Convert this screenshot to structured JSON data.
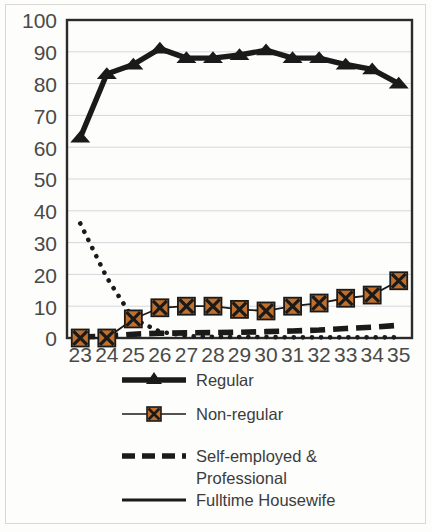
{
  "figure": {
    "kind": "line-chart",
    "background_color": "#fdfdfc",
    "plot_border_color": "#2b2b2b",
    "gridline_color": "#d5d7dc",
    "line_color": "#1a1a1a",
    "marker_fill_color": "#c0702c"
  },
  "chart_data": {
    "type": "line",
    "title": "",
    "subtitle": "",
    "xlabel": "",
    "ylabel": "",
    "x": [
      23,
      24,
      25,
      26,
      27,
      28,
      29,
      30,
      31,
      32,
      33,
      34,
      35
    ],
    "xtick_labels": [
      "23",
      "24",
      "25",
      "26",
      "27",
      "28",
      "29",
      "30",
      "31",
      "32",
      "33",
      "34",
      "35"
    ],
    "ytick_labels": [
      "0",
      "10",
      "20",
      "30",
      "40",
      "50",
      "60",
      "70",
      "80",
      "90",
      "100"
    ],
    "ylim": [
      0,
      100
    ],
    "ytick_step": 10,
    "grid": "horizontal",
    "legend_position": "bottom",
    "series": [
      {
        "name": "Regular",
        "style": "solid-thick",
        "marker": "triangle",
        "marker_fill": "#1a1a1a",
        "values": [
          63,
          83,
          86,
          91,
          88,
          88,
          89,
          90.5,
          88,
          88,
          86,
          84.5,
          80
        ]
      },
      {
        "name": "Non-regular",
        "style": "solid-thin",
        "marker": "square-x",
        "marker_fill": "#c0702c",
        "values": [
          0,
          0,
          6,
          9.5,
          10,
          10,
          9,
          8.5,
          10,
          11,
          12.5,
          13.5,
          18
        ]
      },
      {
        "name": "Self-employed & Professional",
        "style": "dashed-thick",
        "marker": "none",
        "marker_fill": "#1a1a1a",
        "values": [
          0.3,
          0.6,
          1.2,
          1.5,
          1.6,
          1.7,
          1.8,
          2.0,
          2.2,
          2.5,
          3.0,
          3.4,
          4.0
        ]
      },
      {
        "name": "Fulltime Housewife",
        "style": "dotted",
        "marker": "none",
        "marker_fill": "#1a1a1a",
        "values": [
          36,
          19,
          6,
          2,
          0.6,
          0.4,
          0.3,
          0.3,
          0.2,
          0.2,
          0.2,
          0.2,
          0.2
        ]
      }
    ]
  },
  "legend": {
    "entries": [
      {
        "label": "Regular",
        "swatch": "line-with-triangle-marker"
      },
      {
        "label": "Non-regular",
        "swatch": "line-with-square-x-marker"
      },
      {
        "label": "Self-employed &",
        "label_line2": "Professional",
        "swatch": "dashed-line"
      },
      {
        "label": "Fulltime Housewife",
        "swatch": "solid-line"
      }
    ]
  }
}
